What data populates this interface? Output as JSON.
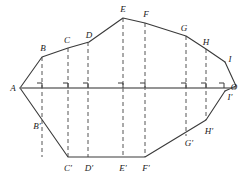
{
  "figure": {
    "colors": {
      "outline": "#3a3a3a",
      "axis": "#707070",
      "dashed": "#555555",
      "background": "#ffffff",
      "label": "#1a1a1a"
    },
    "axis": {
      "name": "horizontal-axis-line",
      "x1": 20,
      "y1": 88,
      "x2": 236,
      "y2": 88
    },
    "right_angle_marks": [
      {
        "name": "right-angle-mark-B",
        "x": 42
      },
      {
        "name": "right-angle-mark-C",
        "x": 68
      },
      {
        "name": "right-angle-mark-D",
        "x": 88
      },
      {
        "name": "right-angle-mark-E",
        "x": 123
      },
      {
        "name": "right-angle-mark-F",
        "x": 145
      },
      {
        "name": "right-angle-mark-G",
        "x": 186
      },
      {
        "name": "right-angle-mark-H",
        "x": 206
      },
      {
        "name": "right-angle-mark-I",
        "x": 224
      }
    ],
    "upper_outline_points": "20,88 42,57 68,48 89,42 123,18 145,23 186,36 206,49 225,62",
    "lower_outline_points": "20,88 68,157 88,157 123,157 145,157 206,120 225,91",
    "right_edge_points": "225,62 236,86 225,91",
    "dashed_chords": [
      {
        "name": "chord-BB",
        "x": 42,
        "y_top": 57,
        "y_bottom": 157
      },
      {
        "name": "chord-CC",
        "x": 68,
        "y_top": 48,
        "y_bottom": 157
      },
      {
        "name": "chord-DD",
        "x": 88,
        "y_top": 42,
        "y_bottom": 157
      },
      {
        "name": "chord-EE",
        "x": 123,
        "y_top": 18,
        "y_bottom": 157
      },
      {
        "name": "chord-FF",
        "x": 145,
        "y_top": 23,
        "y_bottom": 157
      },
      {
        "name": "chord-GG",
        "x": 186,
        "y_top": 36,
        "y_bottom": 136
      },
      {
        "name": "chord-HH",
        "x": 206,
        "y_top": 49,
        "y_bottom": 120
      }
    ],
    "labels": [
      {
        "name": "point-label-A",
        "text": "A",
        "x": 13,
        "y": 88
      },
      {
        "name": "point-label-B",
        "text": "B",
        "x": 43,
        "y": 48
      },
      {
        "name": "point-label-C",
        "text": "C",
        "x": 67,
        "y": 40
      },
      {
        "name": "point-label-D",
        "text": "D",
        "x": 89,
        "y": 35
      },
      {
        "name": "point-label-E",
        "text": "E",
        "x": 123,
        "y": 9
      },
      {
        "name": "point-label-F",
        "text": "F",
        "x": 146,
        "y": 14
      },
      {
        "name": "point-label-G",
        "text": "G",
        "x": 184,
        "y": 28
      },
      {
        "name": "point-label-H",
        "text": "H",
        "x": 206,
        "y": 42
      },
      {
        "name": "point-label-I",
        "text": "I",
        "x": 230,
        "y": 59
      },
      {
        "name": "point-label-O",
        "text": "O",
        "x": 234,
        "y": 87
      },
      {
        "name": "point-label-I-prime",
        "text": "I′",
        "x": 230,
        "y": 97
      },
      {
        "name": "point-label-B-prime",
        "text": "B′",
        "x": 37,
        "y": 126
      },
      {
        "name": "point-label-C-prime",
        "text": "C′",
        "x": 68,
        "y": 168
      },
      {
        "name": "point-label-D-prime",
        "text": "D′",
        "x": 89,
        "y": 168
      },
      {
        "name": "point-label-E-prime",
        "text": "E′",
        "x": 123,
        "y": 168
      },
      {
        "name": "point-label-F-prime",
        "text": "F′",
        "x": 146,
        "y": 168
      },
      {
        "name": "point-label-G-prime",
        "text": "G′",
        "x": 189,
        "y": 143
      },
      {
        "name": "point-label-H-prime",
        "text": "H′",
        "x": 209,
        "y": 131
      }
    ]
  }
}
